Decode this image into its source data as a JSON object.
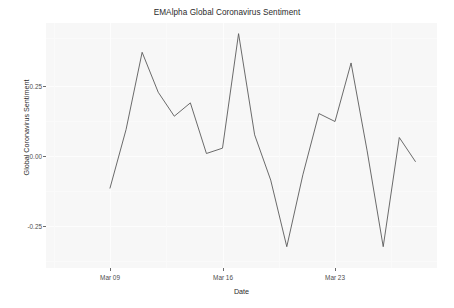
{
  "chart_data": {
    "type": "line",
    "title": "EMAlpha Global Coronavirus Sentiment",
    "xlabel": "Date",
    "ylabel": "Global Coronavirus Sentiment",
    "grid": true,
    "legend": "none",
    "panel_background": "#f7f7f7",
    "line_color": "#5a5a5a",
    "ylim": [
      -0.44,
      0.48
    ],
    "yticks": [
      {
        "value": 0.25,
        "label": "0.25"
      },
      {
        "value": 0.0,
        "label": "0.00"
      },
      {
        "value": -0.25,
        "label": "-0.25"
      }
    ],
    "xticks": [
      {
        "index": 0,
        "label": "Mar 09"
      },
      {
        "index": 7,
        "label": "Mar 16"
      },
      {
        "index": 14,
        "label": "Mar 23"
      }
    ],
    "x": [
      "Mar 09",
      "Mar 10",
      "Mar 11",
      "Mar 12",
      "Mar 13",
      "Mar 14",
      "Mar 15",
      "Mar 16",
      "Mar 17",
      "Mar 18",
      "Mar 19",
      "Mar 20",
      "Mar 21",
      "Mar 22",
      "Mar 23",
      "Mar 24",
      "Mar 25",
      "Mar 26",
      "Mar 27",
      "Mar 28"
    ],
    "values": [
      -0.14,
      0.08,
      0.37,
      0.22,
      0.13,
      0.18,
      -0.01,
      0.01,
      0.44,
      0.06,
      -0.11,
      -0.36,
      -0.09,
      0.14,
      0.11,
      0.33,
      0.0,
      -0.36,
      0.05,
      -0.04
    ]
  },
  "chart": {
    "title": "EMAlpha Global Coronavirus Sentiment",
    "xlabel": "Date",
    "ylabel": "Global Coronavirus Sentiment",
    "ytick_labels": [
      "0.25",
      "0.00",
      "-0.25"
    ],
    "xtick_labels": [
      "Mar 09",
      "Mar 16",
      "Mar 23"
    ]
  }
}
